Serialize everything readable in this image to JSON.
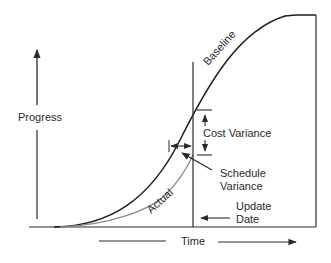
{
  "diagram": {
    "labels": {
      "y_axis": "Progress",
      "x_axis": "Time",
      "baseline": "Baseline",
      "actual": "Actual",
      "cost_variance": "Cost Variance",
      "schedule_variance_line1": "Schedule",
      "schedule_variance_line2": "Variance",
      "update_date_line1": "Update",
      "update_date_line2": "Date"
    },
    "curves": [
      {
        "name": "Baseline",
        "color": "#1e1e1e"
      },
      {
        "name": "Actual",
        "color": "#8a8a8a"
      }
    ],
    "colors": {
      "line": "#2a2a2a",
      "baseline_curve": "#1e1e1e",
      "actual_curve": "#8a8a8a"
    }
  }
}
